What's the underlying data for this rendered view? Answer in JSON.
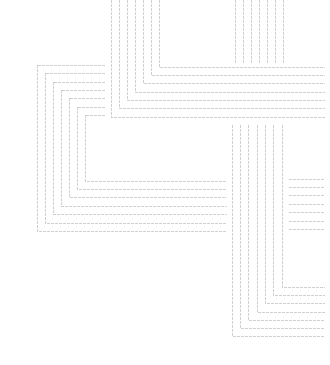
{
  "image": {
    "width": 330,
    "height": 365,
    "background": "#ffffff",
    "line_color": "#cfcfcf",
    "description": "Abstract line art of nested right-angle bracket groups"
  },
  "groups": [
    {
      "name": "top-center-nested-corners",
      "paths": [
        "M111,0 V117 H325",
        "M119,0 V108 H325",
        "M127,0 V100 H325",
        "M135,0 V92 H325",
        "M143,0 V83 H325",
        "M151,0 V75 H325",
        "M159,0 V67 H325"
      ]
    },
    {
      "name": "top-right-vertical-stubs",
      "paths": [
        "M235,0 V63",
        "M243,0 V63",
        "M251,0 V63",
        "M259,0 V63",
        "M267,0 V63",
        "M275,0 V63",
        "M283,0 V63"
      ]
    },
    {
      "name": "left-nested-brackets",
      "paths": [
        "M105,65 H37 V231 H227",
        "M105,73 H45 V223 H227",
        "M105,82 H53 V214 H227",
        "M105,90 H61 V206 H227",
        "M105,98 H69 V197 H227",
        "M105,107 H77 V189 H227",
        "M105,115 H85 V181 H227"
      ]
    },
    {
      "name": "bottom-right-nested-corners",
      "paths": [
        "M232,125 V336 H325",
        "M240,125 V328 H325",
        "M248,125 V320 H325",
        "M257,125 V312 H325",
        "M265,125 V303 H325",
        "M273,125 V295 H325",
        "M282,125 V287 H325"
      ]
    },
    {
      "name": "right-horizontal-stubs",
      "paths": [
        "M289,179 H325",
        "M289,187 H325",
        "M289,195 H325",
        "M289,204 H325",
        "M289,212 H325",
        "M289,221 H325",
        "M289,229 H325"
      ]
    }
  ]
}
